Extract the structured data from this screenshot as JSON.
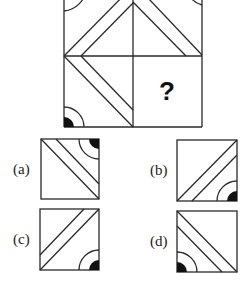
{
  "puzzle": {
    "grid": {
      "cells": [
        {
          "position": "top-left",
          "pattern": "double-line-antidiagonal",
          "arc_corner": "top-left"
        },
        {
          "position": "top-right",
          "pattern": "double-line-diagonal",
          "arc_corner": "top-right"
        },
        {
          "position": "bottom-left",
          "pattern": "double-line-diagonal",
          "arc_corner": "bottom-left"
        },
        {
          "position": "bottom-right",
          "pattern": "unknown",
          "content": "?"
        }
      ],
      "question_mark": "?"
    },
    "options": [
      {
        "label": "(a)",
        "pattern": "double-line-diagonal",
        "arc_corner": "top-right"
      },
      {
        "label": "(b)",
        "pattern": "double-line-antidiagonal",
        "arc_corner": "bottom-right"
      },
      {
        "label": "(c)",
        "pattern": "double-line-antidiagonal",
        "arc_corner": "bottom-right"
      },
      {
        "label": "(d)",
        "pattern": "double-line-diagonal",
        "arc_corner": "bottom-left"
      }
    ]
  },
  "colors": {
    "line": "#2a2a2a",
    "fill": "#111111",
    "background": "#ffffff"
  }
}
